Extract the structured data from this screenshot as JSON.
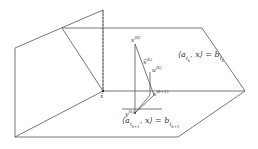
{
  "diagram": {
    "type": "geometric-projection-illustration",
    "colors": {
      "line": "#555555",
      "text": "#333333",
      "background": "#ffffff"
    },
    "labels": {
      "plane_top": {
        "lhs": "⟨a",
        "sub": "i",
        "subsub": "k",
        "mid": ", x⟩ = b",
        "rsub": "i",
        "rsubsub": "k"
      },
      "plane_bottom": {
        "lhs": "⟨a",
        "sub": "i",
        "subsub": "k+1",
        "mid": ", x⟩ = b",
        "rsub": "i",
        "rsubsub": "k+1"
      },
      "x_bar": "x̄",
      "x0": {
        "base": "x",
        "sup": "(0)"
      },
      "xbar_k": {
        "base": "x̄",
        "sup": "(k)"
      },
      "u_k": {
        "base": "u",
        "sup": "(k)"
      },
      "x_k1": {
        "base": "x",
        "sup": "(k+1)"
      },
      "y_k": {
        "base": "y",
        "sup": "(k)"
      }
    }
  }
}
